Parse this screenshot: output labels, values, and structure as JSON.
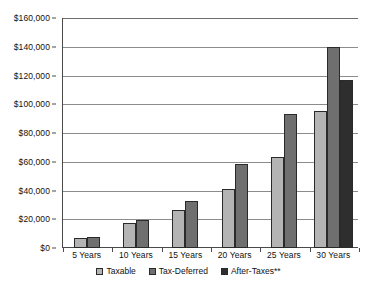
{
  "chart_data": {
    "type": "bar",
    "title": "",
    "subtitle": "",
    "xlabel": "",
    "ylabel": "",
    "categories": [
      "5 Years",
      "10 Years",
      "15 Years",
      "20 Years",
      "25 Years",
      "30 Years"
    ],
    "series": [
      {
        "name": "Taxable",
        "color": "#b4b4b4",
        "values": [
          6800,
          17300,
          26300,
          40800,
          63300,
          95500
        ]
      },
      {
        "name": "Tax-Deferred",
        "color": "#6f6f6f",
        "values": [
          7600,
          19700,
          32400,
          58400,
          93200,
          139800
        ]
      },
      {
        "name": "After-Taxes**",
        "color": "#2e2e2e",
        "values": [
          null,
          null,
          null,
          null,
          null,
          116700
        ]
      }
    ],
    "ylim": [
      0,
      160000
    ],
    "ytick_values": [
      0,
      20000,
      40000,
      60000,
      80000,
      100000,
      120000,
      140000,
      160000
    ],
    "ytick_labels": [
      "$0",
      "$20,000",
      "$40,000",
      "$60,000",
      "$80,000",
      "$100,000",
      "$120,000",
      "$140,000",
      "$160,000"
    ],
    "grid": "horizontal",
    "legend_position": "bottom",
    "legend_entries": [
      "Taxable",
      "Tax-Deferred",
      "After-Taxes**"
    ]
  }
}
